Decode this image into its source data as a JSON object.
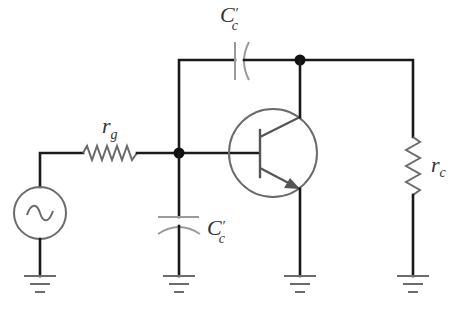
{
  "diagram": {
    "type": "circuit-schematic",
    "colors": {
      "wire": "#1a1a1a",
      "component": "#6b6b6b",
      "component_light": "#9a9a9a",
      "label": "#333333",
      "background": "#ffffff"
    },
    "labels": {
      "source_resistor": {
        "main": "r",
        "sub": "g"
      },
      "feedback_capacitor": {
        "main": "C",
        "prime": "′",
        "sub": "c"
      },
      "input_capacitor": {
        "main": "C",
        "prime": "′",
        "sub": "c"
      },
      "load_resistor": {
        "main": "r",
        "sub": "c"
      }
    },
    "components": [
      {
        "id": "ac-source",
        "kind": "ac-voltage-source",
        "symbol": "~"
      },
      {
        "id": "r_g",
        "kind": "resistor"
      },
      {
        "id": "Cc-feedback",
        "kind": "capacitor",
        "connects": "base-node to collector-node"
      },
      {
        "id": "Cc-input",
        "kind": "capacitor",
        "connects": "base-node to ground"
      },
      {
        "id": "bjt",
        "kind": "npn-transistor"
      },
      {
        "id": "r_c",
        "kind": "resistor",
        "connects": "collector-node to ground"
      }
    ],
    "grounds": 4,
    "junction_dots": 2
  }
}
